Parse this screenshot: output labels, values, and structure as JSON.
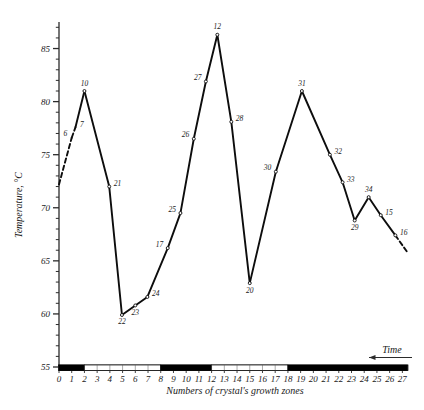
{
  "chart_data": {
    "type": "line",
    "title": "",
    "xlabel": "Numbers of crystal's growth zones",
    "ylabel": "Temperature, °C",
    "xlim": [
      0,
      27.6
    ],
    "ylim": [
      55,
      87.5
    ],
    "grid": false,
    "legend": "none",
    "y_ticks_major": [
      55,
      60,
      65,
      70,
      75,
      80,
      85
    ],
    "y_tick_labels": [
      "55",
      "60",
      "65",
      "70",
      "75",
      "80",
      "85"
    ],
    "y_minor_tick_step": 1,
    "x_ticks": [
      0,
      1,
      2,
      3,
      4,
      5,
      6,
      7,
      8,
      9,
      10,
      11,
      12,
      13,
      14,
      15,
      16,
      17,
      18,
      19,
      20,
      21,
      22,
      23,
      24,
      25,
      26,
      27
    ],
    "x_tick_labels": [
      "0",
      "1",
      "2",
      "3",
      "4",
      "5",
      "6",
      "7",
      "8",
      "9",
      "10",
      "11",
      "12",
      "13",
      "14",
      "15",
      "16",
      "17",
      "18",
      "19",
      "20",
      "21",
      "22",
      "23",
      "24",
      "25",
      "26",
      "27"
    ],
    "time_arrow_label": "Time",
    "time_arrow_direction": "left",
    "zone_bar": [
      {
        "from": 0.0,
        "to": 2.0,
        "shade": "dark"
      },
      {
        "from": 2.0,
        "to": 8.0,
        "shade": "light"
      },
      {
        "from": 8.0,
        "to": 12.0,
        "shade": "dark"
      },
      {
        "from": 12.0,
        "to": 18.0,
        "shade": "light"
      },
      {
        "from": 18.0,
        "to": 27.4,
        "shade": "dark"
      }
    ],
    "series": [
      {
        "name": "temperature",
        "points": [
          {
            "x": 0.0,
            "y": 72.2,
            "label": "",
            "label_pos": "none",
            "marker": false,
            "dashed_from_here": true
          },
          {
            "x": 1.0,
            "y": 76.6,
            "label": "6",
            "label_pos": "left",
            "marker": false,
            "dashed_from_here": true
          },
          {
            "x": 1.3,
            "y": 77.6,
            "label": "7",
            "label_pos": "right",
            "marker": false,
            "dashed_from_here": false
          },
          {
            "x": 2.0,
            "y": 81.0,
            "label": "10",
            "label_pos": "above",
            "marker": true,
            "dashed_from_here": false
          },
          {
            "x": 3.95,
            "y": 72.0,
            "label": "21",
            "label_pos": "right",
            "marker": true,
            "dashed_from_here": false
          },
          {
            "x": 4.95,
            "y": 59.9,
            "label": "22",
            "label_pos": "below",
            "marker": true,
            "dashed_from_here": false
          },
          {
            "x": 6.0,
            "y": 60.8,
            "label": "23",
            "label_pos": "below",
            "marker": true,
            "dashed_from_here": false
          },
          {
            "x": 6.95,
            "y": 61.6,
            "label": "24",
            "label_pos": "right",
            "marker": true,
            "dashed_from_here": false
          },
          {
            "x": 8.55,
            "y": 66.2,
            "label": "17",
            "label_pos": "left",
            "marker": true,
            "dashed_from_here": false
          },
          {
            "x": 9.55,
            "y": 69.5,
            "label": "25",
            "label_pos": "left",
            "marker": true,
            "dashed_from_here": false
          },
          {
            "x": 10.6,
            "y": 76.5,
            "label": "26",
            "label_pos": "left",
            "marker": true,
            "dashed_from_here": false
          },
          {
            "x": 11.55,
            "y": 81.9,
            "label": "27",
            "label_pos": "left",
            "marker": true,
            "dashed_from_here": false
          },
          {
            "x": 12.45,
            "y": 86.3,
            "label": "12",
            "label_pos": "above",
            "marker": true,
            "dashed_from_here": false
          },
          {
            "x": 13.55,
            "y": 78.1,
            "label": "28",
            "label_pos": "right",
            "marker": true,
            "dashed_from_here": false
          },
          {
            "x": 15.0,
            "y": 62.9,
            "label": "20",
            "label_pos": "below",
            "marker": true,
            "dashed_from_here": false
          },
          {
            "x": 17.05,
            "y": 73.4,
            "label": "30",
            "label_pos": "left",
            "marker": true,
            "dashed_from_here": false
          },
          {
            "x": 19.1,
            "y": 81.0,
            "label": "31",
            "label_pos": "above",
            "marker": true,
            "dashed_from_here": false
          },
          {
            "x": 21.3,
            "y": 75.0,
            "label": "32",
            "label_pos": "right",
            "marker": true,
            "dashed_from_here": false
          },
          {
            "x": 22.3,
            "y": 72.4,
            "label": "33",
            "label_pos": "right",
            "marker": true,
            "dashed_from_here": false
          },
          {
            "x": 23.25,
            "y": 68.8,
            "label": "29",
            "label_pos": "below",
            "marker": true,
            "dashed_from_here": false
          },
          {
            "x": 24.35,
            "y": 71.0,
            "label": "34",
            "label_pos": "above",
            "marker": true,
            "dashed_from_here": false
          },
          {
            "x": 25.3,
            "y": 69.3,
            "label": "15",
            "label_pos": "right",
            "marker": true,
            "dashed_from_here": false
          },
          {
            "x": 26.45,
            "y": 67.4,
            "label": "16",
            "label_pos": "right",
            "marker": true,
            "dashed_from_here": true
          },
          {
            "x": 27.4,
            "y": 65.8,
            "label": "",
            "label_pos": "none",
            "marker": false,
            "dashed_from_here": false
          }
        ]
      }
    ],
    "colors": {
      "line": "#0d0d0d",
      "axis": "#2b2b2b",
      "text": "#1a1a1a",
      "bar_dark": "#000000",
      "bar_light": "#ffffff",
      "background": "#ffffff"
    }
  }
}
